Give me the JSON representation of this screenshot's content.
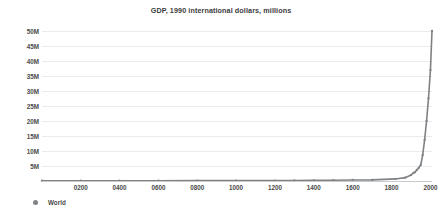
{
  "chart_data": {
    "type": "line",
    "title": "GDP, 1990 international dollars, millions",
    "xlabel": "",
    "ylabel": "",
    "xlim": [
      1,
      2008
    ],
    "ylim": [
      0,
      50000000
    ],
    "grid": true,
    "legend_position": "bottom-left",
    "x_tick_labels": [
      "0200",
      "0400",
      "0600",
      "0800",
      "1000",
      "1200",
      "1400",
      "1600",
      "1800",
      "2000"
    ],
    "x_tick_values": [
      200,
      400,
      600,
      800,
      1000,
      1200,
      1400,
      1600,
      1800,
      2000
    ],
    "y_tick_labels": [
      "50M",
      "45M",
      "40M",
      "35M",
      "30M",
      "25M",
      "20M",
      "15M",
      "10M",
      "5M"
    ],
    "y_tick_values": [
      50000000,
      45000000,
      40000000,
      35000000,
      30000000,
      25000000,
      20000000,
      15000000,
      10000000,
      5000000
    ],
    "series": [
      {
        "name": "World",
        "color": "#7f8285",
        "marker": "circle",
        "x": [
          1,
          200,
          400,
          600,
          800,
          1000,
          1200,
          1300,
          1400,
          1500,
          1600,
          1700,
          1820,
          1870,
          1900,
          1913,
          1920,
          1930,
          1940,
          1950,
          1960,
          1970,
          1980,
          1990,
          2000,
          2008
        ],
        "values": [
          102536,
          105400,
          103700,
          104500,
          110000,
          121208,
          158000,
          178000,
          210000,
          248321,
          331450,
          371369,
          694442,
          1111968,
          1973000,
          2733190,
          2900000,
          3680000,
          4400000,
          5336000,
          8600000,
          13700000,
          20000000,
          27540000,
          37000000,
          50000000
        ]
      }
    ],
    "legend": [
      {
        "label": "World",
        "color": "#7f8285"
      }
    ]
  },
  "chart": {
    "title": "GDP, 1990 international dollars, millions"
  }
}
